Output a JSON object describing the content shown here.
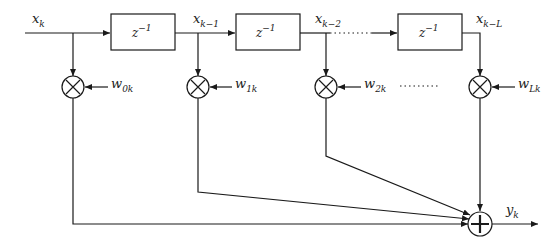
{
  "diagram": {
    "input": {
      "base": "x",
      "sub": "k"
    },
    "delays": [
      {
        "base": "z",
        "sup": "−1"
      },
      {
        "base": "z",
        "sup": "−1"
      },
      {
        "base": "z",
        "sup": "−1"
      }
    ],
    "taps": [
      {
        "base": "x",
        "sub": "k−1"
      },
      {
        "base": "x",
        "sub": "k−2"
      },
      {
        "base": "x",
        "sub": "k−L"
      }
    ],
    "weights": [
      {
        "base": "w",
        "sub": "0k"
      },
      {
        "base": "w",
        "sub": "1k"
      },
      {
        "base": "w",
        "sub": "2k"
      },
      {
        "base": "w",
        "sub": "Lk"
      }
    ],
    "multiplier_symbol": "×",
    "adder_symbol": "+",
    "output": {
      "base": "y",
      "sub": "k"
    },
    "ellipsis": "……"
  }
}
